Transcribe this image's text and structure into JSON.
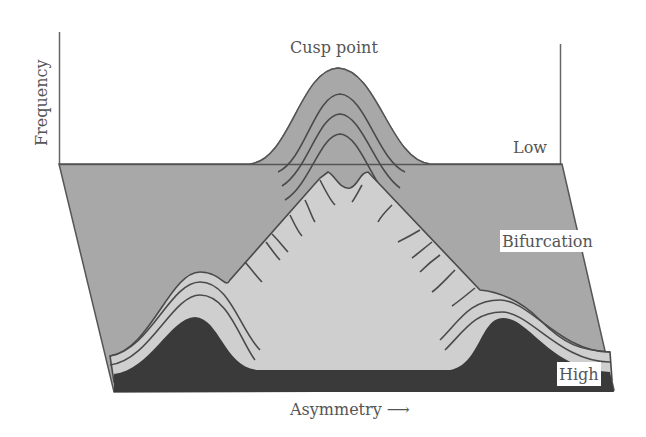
{
  "diagram": {
    "labels": {
      "cusp_point": "Cusp point",
      "frequency": "Frequency",
      "low": "Low",
      "bifurcation": "Bifurcation",
      "high": "High",
      "asymmetry": "Asymmetry ⟶"
    },
    "colors": {
      "back_plane": "#a8a8a8",
      "fold_light": "#cfcfcf",
      "dark_base": "#3a3a3a",
      "contour": "#4a4a4a",
      "axis": "#666666",
      "text": "#555555"
    }
  }
}
